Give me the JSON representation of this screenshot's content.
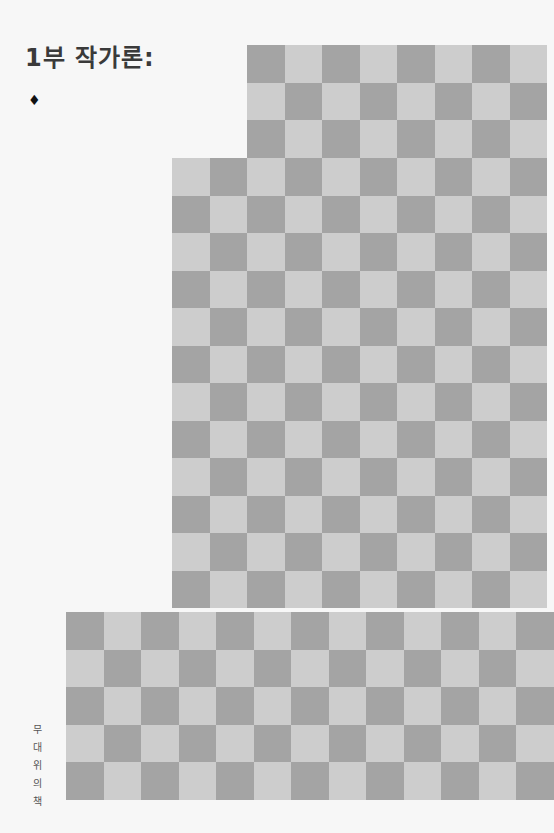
{
  "page": {
    "title": "1부 작가론:",
    "bullet": "♦",
    "running_footer_chars": [
      "무",
      "대",
      "위",
      "의",
      "책"
    ],
    "running_footer": "무대 위의 책"
  },
  "checker_pattern": {
    "cell_size": 37.5,
    "colors": {
      "dark": "#a4a4a4",
      "light": "#cdcdcd"
    },
    "regions": [
      {
        "x": 247,
        "y": 45,
        "cols": 8,
        "rows": 3
      },
      {
        "x": 172,
        "y": 158,
        "cols": 10,
        "rows": 12
      },
      {
        "x": 66,
        "y": 612,
        "cols": 13,
        "rows": 5
      }
    ]
  }
}
